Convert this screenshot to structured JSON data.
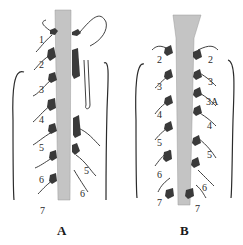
{
  "figure": {
    "type": "anatomical line drawing",
    "colors": {
      "cord": "#c4c4c4",
      "ink": "#2b2b2b",
      "ganglion": "#3a3a3a",
      "background": "#ffffff"
    },
    "panels": [
      {
        "id": "A",
        "label": "A",
        "left_labels": [
          "1",
          "2",
          "3",
          "4",
          "5",
          "6",
          "7"
        ],
        "right_labels": [
          "5",
          "6"
        ]
      },
      {
        "id": "B",
        "label": "B",
        "left_labels": [
          "2",
          "3",
          "4",
          "5",
          "6",
          "7"
        ],
        "right_labels": [
          "2",
          "3",
          "3A",
          "4",
          "5",
          "6",
          "7"
        ]
      }
    ]
  }
}
